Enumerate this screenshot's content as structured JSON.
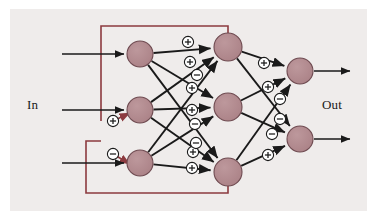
{
  "figure": {
    "type": "neural-network-diagram",
    "title": "",
    "background_color": "#efeceb",
    "page_color": "#ffffff",
    "labels": {
      "input_label": "In",
      "output_label": "Out"
    },
    "colors": {
      "node_fill": "#b08a8f",
      "node_stroke": "#6e4a50",
      "arrow": "#1a1a1a",
      "feedback_line": "#8c3a3f",
      "sign_circle_fill": "#ffffff",
      "sign_circle_stroke": "#1a1a1a",
      "text": "#1a1a1a"
    },
    "layers": [
      {
        "name": "input-layer",
        "node_count": 3,
        "nodes": [
          {
            "id": "i1",
            "cx": 140,
            "cy": 54,
            "r": 13
          },
          {
            "id": "i2",
            "cx": 140,
            "cy": 110,
            "r": 13
          },
          {
            "id": "i3",
            "cx": 140,
            "cy": 163,
            "r": 13
          }
        ]
      },
      {
        "name": "hidden-layer",
        "node_count": 3,
        "nodes": [
          {
            "id": "h1",
            "cx": 228,
            "cy": 47,
            "r": 14
          },
          {
            "id": "h2",
            "cx": 228,
            "cy": 107,
            "r": 14
          },
          {
            "id": "h3",
            "cx": 228,
            "cy": 172,
            "r": 14
          }
        ]
      },
      {
        "name": "output-layer",
        "node_count": 2,
        "nodes": [
          {
            "id": "o1",
            "cx": 300,
            "cy": 71,
            "r": 13
          },
          {
            "id": "o2",
            "cx": 300,
            "cy": 139,
            "r": 13
          }
        ]
      }
    ],
    "input_arrows": [
      {
        "id": "in-arrow-1",
        "x1": 62,
        "y1": 54,
        "x2": 124,
        "y2": 54
      },
      {
        "id": "in-arrow-2",
        "x1": 62,
        "y1": 110,
        "x2": 124,
        "y2": 110
      },
      {
        "id": "in-arrow-3",
        "x1": 62,
        "y1": 163,
        "x2": 124,
        "y2": 163
      }
    ],
    "output_arrows": [
      {
        "id": "out-arrow-1",
        "x1": 314,
        "y1": 71,
        "x2": 350,
        "y2": 71
      },
      {
        "id": "out-arrow-2",
        "x1": 314,
        "y1": 139,
        "x2": 350,
        "y2": 139
      }
    ],
    "input_hidden_connections": [
      {
        "from": "i1",
        "to": "h1",
        "sign": "+",
        "sign_x": 188,
        "sign_y": 42
      },
      {
        "from": "i1",
        "to": "h2",
        "sign": "+",
        "sign_x": 192,
        "sign_y": 88
      },
      {
        "from": "i1",
        "to": "h3",
        "sign": "+",
        "sign_x": 193,
        "sign_y": 152
      },
      {
        "from": "i2",
        "to": "h1",
        "sign": "+",
        "sign_x": 190,
        "sign_y": 62
      },
      {
        "from": "i2",
        "to": "h2",
        "sign": "+",
        "sign_x": 192,
        "sign_y": 110
      },
      {
        "from": "i2",
        "to": "h3",
        "sign": "-",
        "sign_x": 196,
        "sign_y": 143
      },
      {
        "from": "i3",
        "to": "h1",
        "sign": "-",
        "sign_x": 197,
        "sign_y": 75
      },
      {
        "from": "i3",
        "to": "h2",
        "sign": "-",
        "sign_x": 195,
        "sign_y": 124
      },
      {
        "from": "i3",
        "to": "h3",
        "sign": "+",
        "sign_x": 192,
        "sign_y": 168
      }
    ],
    "hidden_output_connections": [
      {
        "from": "h1",
        "to": "o1",
        "sign": "+",
        "sign_x": 264,
        "sign_y": 63
      },
      {
        "from": "h1",
        "to": "o2",
        "sign": "-",
        "sign_x": 280,
        "sign_y": 99
      },
      {
        "from": "h2",
        "to": "o1",
        "sign": "+",
        "sign_x": 268,
        "sign_y": 87
      },
      {
        "from": "h2",
        "to": "o2",
        "sign": "-",
        "sign_x": 280,
        "sign_y": 119
      },
      {
        "from": "h3",
        "to": "o1",
        "sign": "-",
        "sign_x": 272,
        "sign_y": 134
      },
      {
        "from": "h3",
        "to": "o2",
        "sign": "+",
        "sign_x": 268,
        "sign_y": 155
      }
    ],
    "feedback_connections": [
      {
        "id": "feedback-top",
        "from": "h1",
        "to": "i2",
        "sign": "+",
        "sign_x": 113,
        "sign_y": 121,
        "path": "M 228 33 L 228 26 L 101 26 L 101 121"
      },
      {
        "id": "feedback-bottom",
        "from": "h3",
        "to": "i3",
        "sign": "-",
        "sign_x": 113,
        "sign_y": 154,
        "path": "M 228 186 L 228 193 L 86 193 L 86 141 L 101 141"
      }
    ],
    "feedback_stub_arrows": [
      {
        "id": "feedback-arrow-1",
        "x1": 113,
        "y1": 121,
        "x2": 130,
        "y2": 113
      },
      {
        "id": "feedback-arrow-2",
        "x1": 113,
        "y1": 154,
        "x2": 130,
        "y2": 164
      }
    ]
  }
}
